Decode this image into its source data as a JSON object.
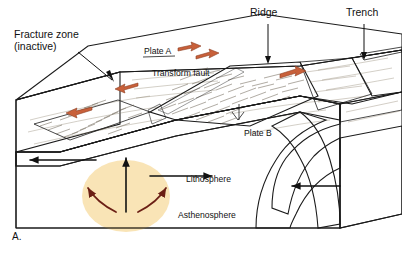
{
  "figure": {
    "panel_label": "A.",
    "kind": "geology-block-diagram"
  },
  "labels": {
    "fracture_zone_line1": "Fracture zone",
    "fracture_zone_line2": "(inactive)",
    "ridge": "Ridge",
    "trench": "Trench",
    "plate_a": "Plate A",
    "plate_b": "Plate B",
    "transform_fault": "Transform fault",
    "lithosphere": "Lithosphere",
    "asthenosphere": "Asthenosphere"
  },
  "colors": {
    "ocean_water": "#a8bed0",
    "water_top": "#b9cbd9",
    "seafloor_light": "#d8cdb4",
    "seafloor_tan": "#c3b494",
    "ridge_rock": "#9a7f5e",
    "ridge_rock_dark": "#7d6546",
    "lithosphere": "#9aa79c",
    "lithosphere_dark": "#83918a",
    "asthenosphere": "#d2763f",
    "asthenosphere_hot": "#f0b552",
    "motion_arrow": "#c8603a",
    "mantle_arrow": "#6b1f15",
    "plate_arrow": "#111111",
    "outline": "#1b1b1b",
    "label_text": "#111111",
    "background": "#ffffff"
  },
  "features": {
    "plate_motion_arrows": [
      {
        "name": "plate-a-spreading-arrow-right-upper",
        "direction": "right"
      },
      {
        "name": "plate-a-spreading-arrow-right-mid",
        "direction": "right"
      },
      {
        "name": "plate-a-spreading-arrow-left-upper",
        "direction": "left"
      },
      {
        "name": "plate-a-spreading-arrow-left-lower",
        "direction": "left"
      },
      {
        "name": "plate-b-spreading-arrow-right",
        "direction": "right"
      }
    ],
    "lithosphere_arrows": [
      {
        "name": "lithosphere-arrow-left",
        "direction": "left"
      },
      {
        "name": "lithosphere-arrow-right",
        "direction": "right"
      },
      {
        "name": "lithosphere-arrow-subduction",
        "direction": "left"
      }
    ],
    "mantle_convection": [
      {
        "name": "mantle-upwelling-arrow",
        "direction": "up"
      },
      {
        "name": "mantle-diverge-arrow-left",
        "direction": "left"
      },
      {
        "name": "mantle-diverge-arrow-right",
        "direction": "right"
      }
    ]
  }
}
